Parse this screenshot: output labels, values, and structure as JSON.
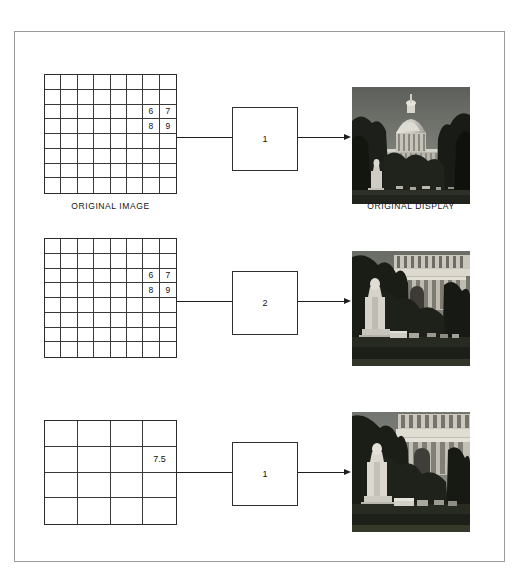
{
  "figure": {
    "background_color": "#ffffff",
    "frame_color": "#9a9a9a",
    "line_color": "#1f1f1f"
  },
  "rows": [
    {
      "id": "row-original",
      "grid": {
        "kind": "pixel-grid",
        "columns": 8,
        "rows": 8,
        "values": [
          {
            "row": 3,
            "col": 7,
            "text": "6"
          },
          {
            "row": 3,
            "col": 8,
            "text": "7"
          },
          {
            "row": 4,
            "col": 7,
            "text": "8"
          },
          {
            "row": 4,
            "col": 8,
            "text": "9"
          }
        ],
        "caption": "ORIGINAL IMAGE"
      },
      "box": {
        "label": "1"
      },
      "photo": {
        "name": "capitol-original-display",
        "caption": "ORIGINAL DISPLAY",
        "scene": "wide"
      }
    },
    {
      "id": "row-zoom-2x",
      "grid": {
        "kind": "pixel-grid",
        "columns": 8,
        "rows": 8,
        "values": [
          {
            "row": 3,
            "col": 7,
            "text": "6"
          },
          {
            "row": 3,
            "col": 8,
            "text": "7"
          },
          {
            "row": 4,
            "col": 7,
            "text": "8"
          },
          {
            "row": 4,
            "col": 8,
            "text": "9"
          }
        ],
        "caption": ""
      },
      "box": {
        "label": "2"
      },
      "photo": {
        "name": "capitol-zoom-replication",
        "caption": "",
        "scene": "zoom"
      }
    },
    {
      "id": "row-interpolated",
      "grid": {
        "kind": "pixel-grid",
        "columns": 4,
        "rows": 4,
        "values": [
          {
            "row": 2,
            "col": 4,
            "text": "7.5"
          }
        ],
        "caption": ""
      },
      "box": {
        "label": "1"
      },
      "photo": {
        "name": "capitol-zoom-interpolated",
        "caption": "",
        "scene": "zoom2"
      }
    }
  ]
}
